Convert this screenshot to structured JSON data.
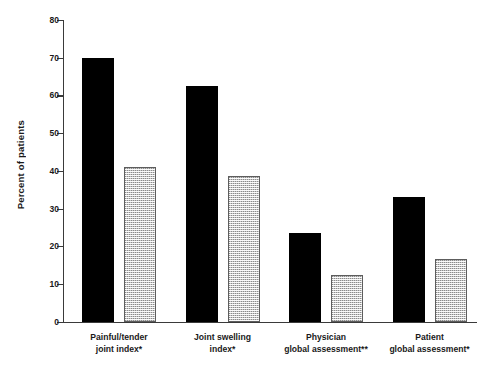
{
  "chart_data": {
    "type": "bar",
    "title": "",
    "xlabel": "",
    "ylabel": "Percent of patients",
    "ylim": [
      0,
      80
    ],
    "yticks": [
      0,
      10,
      20,
      30,
      40,
      50,
      60,
      70,
      80
    ],
    "grid": false,
    "legend": null,
    "categories": [
      "Painful/tender joint index*",
      "Joint swelling index*",
      "Physician global assessment**",
      "Patient global assessment*"
    ],
    "category_lines": [
      [
        "Painful/tender",
        "joint index*"
      ],
      [
        "Joint swelling",
        "index*"
      ],
      [
        "Physician",
        "global assessment**"
      ],
      [
        "Patient",
        "global assessment*"
      ]
    ],
    "series": [
      {
        "name": "black",
        "fill": "solid-black",
        "color": "#000000",
        "values": [
          70,
          62.5,
          23.5,
          33
        ]
      },
      {
        "name": "gray",
        "fill": "stippled-gray",
        "color": "#c9c9c9",
        "values": [
          41,
          38.5,
          12.3,
          16.5
        ]
      }
    ],
    "annotations": [
      "*",
      "**"
    ]
  },
  "axis": {
    "y_tick_labels": [
      "0",
      "10",
      "20",
      "30",
      "40",
      "50",
      "60",
      "70",
      "80"
    ],
    "y_title": "Percent of patients"
  }
}
